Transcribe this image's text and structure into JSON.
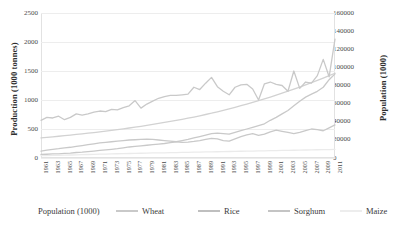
{
  "chart_data": {
    "type": "line",
    "title": "",
    "subtitle": "",
    "xlabel": "",
    "ylabel": "Production (1000 tonnes)",
    "y2label": "Population (1000)",
    "grid": true,
    "grid_axis": "y",
    "legend_position": "bottom",
    "ylim": [
      0,
      2500
    ],
    "y2lim": [
      0,
      160000
    ],
    "yticks": [
      0,
      500,
      1000,
      1500,
      2000,
      2500
    ],
    "y2ticks": [
      0,
      20000,
      40000,
      60000,
      80000,
      100000,
      120000,
      140000,
      160000
    ],
    "ytick_labels": [
      "0",
      "500",
      "1000",
      "1500",
      "2000",
      "2500"
    ],
    "y2tick_labels": [
      "0",
      "20000",
      "40000",
      "60000",
      "80000",
      "100000",
      "120000",
      "140000",
      "160000"
    ],
    "x": [
      1961,
      1962,
      1963,
      1964,
      1965,
      1966,
      1967,
      1968,
      1969,
      1970,
      1971,
      1972,
      1973,
      1974,
      1975,
      1976,
      1977,
      1978,
      1979,
      1980,
      1981,
      1982,
      1983,
      1984,
      1985,
      1986,
      1987,
      1988,
      1989,
      1990,
      1991,
      1992,
      1993,
      1994,
      1995,
      1996,
      1997,
      1998,
      1999,
      2000,
      2001,
      2002,
      2003,
      2004,
      2005,
      2006,
      2007,
      2008,
      2009,
      2010,
      2011
    ],
    "xtick_labels": [
      "1961",
      "1963",
      "1965",
      "1967",
      "1969",
      "1971",
      "1973",
      "1975",
      "1977",
      "1979",
      "1981",
      "1983",
      "1985",
      "1987",
      "1989",
      "1991",
      "1993",
      "1995",
      "1997",
      "1999",
      "2001",
      "2003",
      "2005",
      "2007",
      "2009",
      "2011"
    ],
    "xtick_step": 2,
    "series": [
      {
        "name": "Population (1000)",
        "axis": "right",
        "color": "#d2d2d2",
        "values": [
          22200,
          22800,
          23400,
          24000,
          24600,
          25300,
          26000,
          26700,
          27400,
          28100,
          28900,
          29700,
          30500,
          31400,
          32200,
          33100,
          34000,
          35000,
          36000,
          37000,
          38100,
          39200,
          40300,
          41400,
          42600,
          43900,
          45200,
          46600,
          48000,
          49400,
          51000,
          52600,
          54200,
          55900,
          57700,
          59500,
          61400,
          63300,
          65300,
          67300,
          69400,
          71500,
          73700,
          76000,
          78300,
          80700,
          83100,
          85600,
          88200,
          90800,
          93500
        ]
      },
      {
        "name": "Wheat",
        "axis": "left",
        "color": "#c9c9c9",
        "values": [
          650,
          700,
          690,
          720,
          660,
          700,
          760,
          740,
          760,
          790,
          810,
          800,
          840,
          830,
          870,
          900,
          990,
          860,
          930,
          980,
          1030,
          1060,
          1080,
          1080,
          1090,
          1100,
          1220,
          1180,
          1290,
          1390,
          1230,
          1150,
          1090,
          1220,
          1260,
          1270,
          1190,
          1000,
          1280,
          1310,
          1270,
          1250,
          1150,
          1500,
          1200,
          1310,
          1290,
          1420,
          1700,
          1400,
          2050
        ]
      },
      {
        "name": "Rice",
        "axis": "left",
        "color": "#c9c9c9",
        "values": [
          60,
          65,
          70,
          72,
          80,
          85,
          95,
          100,
          110,
          120,
          130,
          140,
          150,
          160,
          175,
          190,
          200,
          210,
          220,
          230,
          240,
          250,
          265,
          280,
          300,
          320,
          345,
          370,
          395,
          420,
          430,
          420,
          410,
          440,
          470,
          500,
          530,
          560,
          590,
          650,
          700,
          760,
          820,
          900,
          980,
          1050,
          1100,
          1150,
          1220,
          1350,
          1450
        ]
      },
      {
        "name": "Sorghum",
        "axis": "left",
        "color": "#c9c9c9",
        "values": [
          120,
          135,
          150,
          160,
          175,
          185,
          200,
          215,
          230,
          245,
          260,
          270,
          280,
          290,
          300,
          310,
          315,
          320,
          325,
          320,
          310,
          300,
          290,
          280,
          270,
          275,
          285,
          300,
          320,
          340,
          330,
          300,
          290,
          330,
          370,
          400,
          420,
          390,
          410,
          450,
          480,
          460,
          440,
          420,
          440,
          470,
          500,
          490,
          470,
          520,
          570
        ]
      },
      {
        "name": "Maize",
        "axis": "left",
        "color": "#ebebeb",
        "values": [
          40,
          42,
          45,
          47,
          50,
          52,
          55,
          58,
          60,
          63,
          66,
          68,
          70,
          73,
          76,
          78,
          80,
          82,
          85,
          87,
          88,
          90,
          92,
          94,
          96,
          98,
          100,
          102,
          104,
          106,
          108,
          110,
          112,
          114,
          116,
          118,
          120,
          122,
          124,
          126,
          128,
          130,
          132,
          134,
          136,
          138,
          140,
          142,
          144,
          146,
          148
        ]
      }
    ],
    "legend": [
      {
        "label": "Population (1000)",
        "color": "#ffffff",
        "show_swatch": false
      },
      {
        "label": "Wheat",
        "color": "#c9c9c9",
        "show_swatch": true
      },
      {
        "label": "Rice",
        "color": "#bfbfbf",
        "show_swatch": true
      },
      {
        "label": "Sorghum",
        "color": "#c4c4c4",
        "show_swatch": true
      },
      {
        "label": "Maize",
        "color": "#ededed",
        "show_swatch": true
      }
    ]
  },
  "colors": {
    "grid": "#ededed",
    "frame": "#e2e2e2",
    "text": "#3a3a3a",
    "tick_text": "#4a4a4a"
  }
}
